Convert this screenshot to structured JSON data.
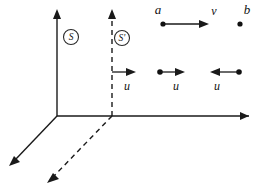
{
  "figure": {
    "background_color": "#ffffff",
    "ink_color": "#111111",
    "width": 258,
    "height": 190
  },
  "frames": [
    {
      "id": "S",
      "label": "S",
      "style": "solid",
      "circled": true,
      "origin": {
        "x": 57,
        "y": 116
      },
      "label_pos": {
        "x": 71,
        "y": 37
      }
    },
    {
      "id": "S-prime",
      "label": "S'",
      "style": "dashed",
      "circled": true,
      "origin": {
        "x": 112,
        "y": 116
      },
      "label_pos": {
        "x": 122,
        "y": 38
      }
    }
  ],
  "axes": [
    {
      "name": "x-axis",
      "style": "solid",
      "from": {
        "x": 57,
        "y": 116
      },
      "to": {
        "x": 249,
        "y": 116
      },
      "arrow": "right"
    },
    {
      "name": "y-axis-S",
      "style": "solid",
      "from": {
        "x": 57,
        "y": 116
      },
      "to": {
        "x": 57,
        "y": 12
      },
      "arrow": "up"
    },
    {
      "name": "z-axis-S",
      "style": "solid",
      "from": {
        "x": 57,
        "y": 116
      },
      "to": {
        "x": 11,
        "y": 164
      },
      "arrow": "down-left"
    },
    {
      "name": "y-axis-S-prime",
      "style": "dashed",
      "from": {
        "x": 112,
        "y": 116
      },
      "to": {
        "x": 112,
        "y": 12
      },
      "arrow": "up"
    },
    {
      "name": "z-axis-S-prime",
      "style": "dashed",
      "from": {
        "x": 112,
        "y": 116
      },
      "to": {
        "x": 49,
        "y": 181
      },
      "arrow": "down-left"
    }
  ],
  "points": [
    {
      "id": "a",
      "label": "a",
      "x": 163,
      "y": 24,
      "label_pos": {
        "x": 158,
        "y": 11
      }
    },
    {
      "id": "b",
      "label": "b",
      "x": 240,
      "y": 24,
      "label_pos": {
        "x": 247,
        "y": 11
      }
    }
  ],
  "vectors": [
    {
      "id": "v-a-to-b",
      "label": "v",
      "direction": "right",
      "from": {
        "x": 164,
        "y": 24
      },
      "to": {
        "x": 207,
        "y": 24
      },
      "label_pos": {
        "x": 214,
        "y": 12
      },
      "has_tail_dot": false
    },
    {
      "id": "u-frame",
      "label": "u",
      "direction": "right",
      "from": {
        "x": 112,
        "y": 72
      },
      "to": {
        "x": 134,
        "y": 72
      },
      "label_pos": {
        "x": 127,
        "y": 86
      },
      "has_tail_dot": false
    },
    {
      "id": "u-middle",
      "label": "u",
      "direction": "right",
      "from": {
        "x": 160,
        "y": 72
      },
      "to": {
        "x": 183,
        "y": 72
      },
      "label_pos": {
        "x": 176,
        "y": 86
      },
      "has_tail_dot": true
    },
    {
      "id": "u-right-reversed",
      "label": "u",
      "direction": "left",
      "from": {
        "x": 239,
        "y": 72
      },
      "to": {
        "x": 212,
        "y": 72
      },
      "label_pos": {
        "x": 217,
        "y": 86
      },
      "has_tail_dot": true
    }
  ]
}
